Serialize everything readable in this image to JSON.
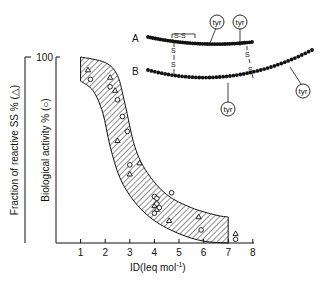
{
  "chart_data": {
    "type": "scatter",
    "title": "",
    "xlabel": "ID(Ieq mol⁻¹)",
    "ylabel_outer": "Fraction of reactive SS % (△)",
    "ylabel_inner": "Biological activity % (○)",
    "xlim": [
      0,
      8
    ],
    "ylim": [
      0,
      100
    ],
    "x_ticks": [
      1,
      2,
      3,
      4,
      5,
      6,
      7,
      8
    ],
    "y_ticks": [
      100
    ],
    "grid": false,
    "legend": "none (markers explained in y-axis labels)",
    "band": {
      "description": "hatched band enclosing data",
      "upper": [
        [
          1.0,
          100
        ],
        [
          2.0,
          97
        ],
        [
          2.5,
          90
        ],
        [
          2.8,
          75
        ],
        [
          3.2,
          52
        ],
        [
          3.7,
          38
        ],
        [
          4.5,
          26
        ],
        [
          5.5,
          19
        ],
        [
          6.5,
          15
        ],
        [
          7.0,
          14
        ]
      ],
      "lower": [
        [
          1.0,
          87
        ],
        [
          1.5,
          82
        ],
        [
          1.9,
          70
        ],
        [
          2.2,
          52
        ],
        [
          2.6,
          35
        ],
        [
          3.2,
          22
        ],
        [
          4.0,
          12
        ],
        [
          5.0,
          5
        ],
        [
          6.0,
          1
        ],
        [
          7.0,
          0
        ]
      ]
    },
    "series": [
      {
        "name": "Fraction of reactive SS (triangles)",
        "marker": "triangle",
        "points": [
          [
            1.3,
            93
          ],
          [
            2.2,
            89
          ],
          [
            2.4,
            82
          ],
          [
            2.5,
            55
          ],
          [
            3.0,
            37
          ],
          [
            3.4,
            43
          ],
          [
            4.0,
            20
          ],
          [
            4.1,
            18
          ],
          [
            4.6,
            12
          ],
          [
            5.8,
            14
          ],
          [
            7.3,
            5
          ]
        ]
      },
      {
        "name": "Biological activity (circles)",
        "marker": "circle",
        "points": [
          [
            1.4,
            88
          ],
          [
            2.2,
            84
          ],
          [
            2.5,
            77
          ],
          [
            2.7,
            68
          ],
          [
            2.9,
            60
          ],
          [
            3.0,
            42
          ],
          [
            4.0,
            25
          ],
          [
            4.1,
            24
          ],
          [
            4.1,
            21
          ],
          [
            4.2,
            19
          ],
          [
            4.0,
            16
          ],
          [
            4.7,
            27
          ],
          [
            5.9,
            7
          ],
          [
            7.3,
            2
          ]
        ]
      }
    ]
  },
  "axes": {
    "y_top_label": "100",
    "x_tick_labels": [
      "1",
      "2",
      "3",
      "4",
      "5",
      "6",
      "7",
      "8"
    ],
    "x_title": "ID(Ieq mol",
    "x_title_sup": "-1",
    "x_title_end": ")",
    "y_outer_title": "Fraction of reactive SS % (△)",
    "y_inner_title": "Biological activity % (○)"
  },
  "inset": {
    "chain_a_label": "A",
    "chain_b_label": "B",
    "tyr_label": "tyr",
    "disulfide_label": "S-S",
    "s_label": "S",
    "description": "Schematic of two peptide chains A and B joined by two inter-chain disulfide bridges, one intra-chain S-S in A, tyrosine residues marked"
  }
}
